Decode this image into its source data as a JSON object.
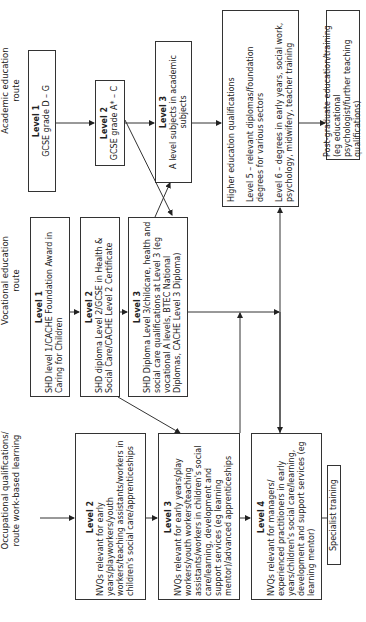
{
  "routes": {
    "academic": "Academic education route",
    "vocational": "Vocational education route",
    "occupational": [
      "Occupational qualifications/",
      "route work-based learning"
    ]
  },
  "academic": {
    "l1": {
      "level": "Level 1",
      "text": "GCSE grade D – G"
    },
    "l2": {
      "level": "Level 2",
      "text": "GCSE grade A* – C"
    },
    "l3": {
      "level": "Level 3",
      "text": "A level subjects in academic subjects"
    }
  },
  "vocational": {
    "l1": {
      "level": "Level 1",
      "text": "SHD level 1/CACHE Foundation Award in Caring for Children"
    },
    "l2": {
      "level": "Level 2",
      "text": "SHD diploma Level 2/GCSE in Health & Social Care/CACHE Level 2 Certificate"
    },
    "l3": {
      "level": "Level 3",
      "text": "SHD Diploma Level 3/childcare, health and social care qualifications at Level 3 (eg vocational A levels, BTEC National Diplomas, CACHE Level 3 Diploma)"
    }
  },
  "occupational": {
    "l2": {
      "level": "Level 2",
      "text": "NVQs relevant for early years/playworkers/youth workers/teaching assistants/workers in children's social care/apprenticeships"
    },
    "l3": {
      "level": "Level 3",
      "text": "NVQs relevant for early years/play workers/youth workers/teaching assistants/workers in children's social care/learning, development and support services (eg learning mentor)/advanced apprenticeships"
    },
    "l4": {
      "level": "Level 4",
      "text": "NVQs relevant for managers/ experienced practitioners in early years/children's social care/learning, development and support services (eg learning mentor)"
    },
    "specialist": "Specialist training"
  },
  "higher_education": {
    "title": "Higher education qualifications",
    "l5": "Level 5 – relevant diplomas/foundation degrees for various sectors",
    "l6": "Level 6 – degrees in early years, social work, psychology, midwifery, teacher training"
  },
  "postgraduate": "Post-graduate education/training (eg educational psychologist/further teaching qualifications)"
}
